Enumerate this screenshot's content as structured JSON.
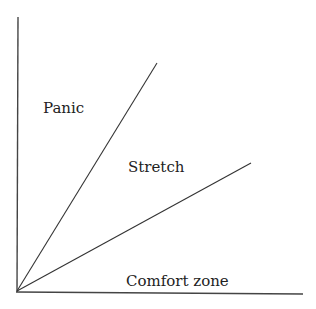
{
  "diagram": {
    "title": "",
    "labels": {
      "panic": "Panic",
      "stretch": "Stretch",
      "comfort": "Comfort zone"
    },
    "colors": {
      "background": "#ffffff",
      "lines": "#333333",
      "text": "#222222"
    },
    "axes": {
      "origin": [
        17,
        291
      ],
      "y_axis_top": [
        18,
        17
      ],
      "x_axis_right": [
        303,
        293
      ]
    },
    "rays": [
      {
        "name": "upper-boundary",
        "from": [
          17,
          291
        ],
        "to": [
          157,
          63
        ]
      },
      {
        "name": "lower-boundary",
        "from": [
          17,
          291
        ],
        "to": [
          251,
          163
        ]
      }
    ]
  }
}
